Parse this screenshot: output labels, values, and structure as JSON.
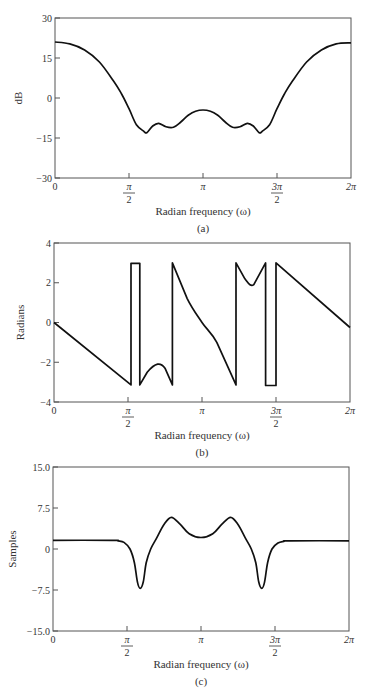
{
  "chart_data": [
    {
      "id": "a",
      "type": "line",
      "caption": "(a)",
      "title": "",
      "xlabel": "Radian frequency (ω)",
      "ylabel": "dB",
      "xlim": [
        0,
        6.2832
      ],
      "ylim": [
        -30,
        30
      ],
      "yticks": [
        "30",
        "15",
        "0",
        "−15",
        "−30"
      ],
      "ytick_values": [
        30,
        15,
        0,
        -15,
        -30
      ],
      "xticks": [
        {
          "value": 0,
          "num": "0",
          "den": ""
        },
        {
          "value": 1.5708,
          "num": "π",
          "den": "2"
        },
        {
          "value": 3.1416,
          "num": "π",
          "den": ""
        },
        {
          "value": 4.7124,
          "num": "3π",
          "den": "2"
        },
        {
          "value": 6.2832,
          "num": "2π",
          "den": ""
        }
      ],
      "grid": false,
      "x_over_pi": [
        0,
        0.1,
        0.2,
        0.3,
        0.4,
        0.45,
        0.5,
        0.55,
        0.6,
        0.62,
        0.66,
        0.7,
        0.75,
        0.8,
        0.85,
        0.9,
        0.95,
        1.0,
        1.05,
        1.1,
        1.15,
        1.2,
        1.25,
        1.3,
        1.34,
        1.38,
        1.4,
        1.45,
        1.5,
        1.55,
        1.6,
        1.7,
        1.8,
        1.9,
        2.0
      ],
      "values": [
        21,
        20.3,
        18,
        13.5,
        6,
        1.5,
        -4,
        -10,
        -12.5,
        -13,
        -10.5,
        -9.5,
        -10.8,
        -11,
        -9,
        -6.5,
        -5,
        -4.5,
        -5,
        -6.5,
        -9,
        -11,
        -10.8,
        -9.5,
        -10.5,
        -13,
        -12.5,
        -10,
        -4,
        1.5,
        6,
        13.5,
        18,
        20.3,
        20.7
      ]
    },
    {
      "id": "b",
      "type": "line",
      "caption": "(b)",
      "title": "",
      "xlabel": "Radian frequency (ω)",
      "ylabel": "Radians",
      "xlim": [
        0,
        6.2832
      ],
      "ylim": [
        -4,
        4
      ],
      "yticks": [
        "4",
        "2",
        "0",
        "−2",
        "−4"
      ],
      "ytick_values": [
        4,
        2,
        0,
        -2,
        -4
      ],
      "xticks": [
        {
          "value": 0,
          "num": "0",
          "den": ""
        },
        {
          "value": 1.5708,
          "num": "π",
          "den": "2"
        },
        {
          "value": 3.1416,
          "num": "π",
          "den": ""
        },
        {
          "value": 4.7124,
          "num": "3π",
          "den": "2"
        },
        {
          "value": 6.2832,
          "num": "2π",
          "den": ""
        }
      ],
      "grid": false,
      "x_over_pi": [
        0,
        0.52,
        0.52,
        0.58,
        0.58,
        0.63,
        0.7,
        0.75,
        0.8,
        0.8,
        0.9,
        1.0,
        1.1,
        1.23,
        1.23,
        1.29,
        1.35,
        1.43,
        1.43,
        1.5,
        1.5,
        2.0
      ],
      "values": [
        0,
        -3.14,
        2.98,
        2.98,
        -3.14,
        -2.5,
        -2.1,
        -2.3,
        -3.14,
        3.0,
        1.2,
        0,
        -1.0,
        -3.14,
        3.0,
        2.2,
        1.9,
        3.0,
        -3.17,
        -3.17,
        3.0,
        -0.25
      ]
    },
    {
      "id": "c",
      "type": "line",
      "caption": "(c)",
      "title": "",
      "xlabel": "Radian frequency (ω)",
      "ylabel": "Samples",
      "xlim": [
        0,
        6.2832
      ],
      "ylim": [
        -15,
        15
      ],
      "yticks": [
        "15.0",
        "7.5",
        "0",
        "−7.5",
        "−15.0"
      ],
      "ytick_values": [
        15,
        7.5,
        0,
        -7.5,
        -15
      ],
      "xticks": [
        {
          "value": 0,
          "num": "0",
          "den": ""
        },
        {
          "value": 1.5708,
          "num": "π",
          "den": "2"
        },
        {
          "value": 3.1416,
          "num": "π",
          "den": ""
        },
        {
          "value": 4.7124,
          "num": "3π",
          "den": "2"
        },
        {
          "value": 6.2832,
          "num": "2π",
          "den": ""
        }
      ],
      "grid": false,
      "x_over_pi": [
        0,
        0.4,
        0.44,
        0.48,
        0.52,
        0.55,
        0.57,
        0.59,
        0.61,
        0.63,
        0.66,
        0.7,
        0.75,
        0.8,
        0.86,
        0.92,
        1.0,
        1.08,
        1.14,
        1.2,
        1.25,
        1.3,
        1.34,
        1.37,
        1.39,
        1.41,
        1.43,
        1.45,
        1.48,
        1.52,
        1.56,
        1.6,
        2.0
      ],
      "values": [
        1.6,
        1.6,
        1.5,
        1.2,
        0,
        -2.5,
        -6,
        -7.2,
        -6,
        -2.5,
        0,
        2,
        4.5,
        5.8,
        4.5,
        2.8,
        2.1,
        2.8,
        4.5,
        5.8,
        4.5,
        2,
        0,
        -2.5,
        -6,
        -7.2,
        -6,
        -2.5,
        0,
        1.1,
        1.4,
        1.5,
        1.5
      ]
    }
  ]
}
